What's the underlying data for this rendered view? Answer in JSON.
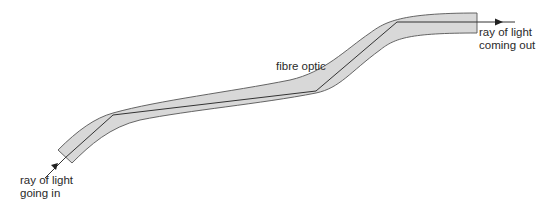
{
  "diagram": {
    "labels": {
      "fibre": "fibre optic",
      "ray_in_line1": "ray of light",
      "ray_in_line2": "going in",
      "ray_out_line1": "ray of light",
      "ray_out_line2": "coming out"
    },
    "colors": {
      "fibre_fill": "#d8d8d8",
      "fibre_outline": "#555555",
      "ray": "#333333",
      "text": "#2a2a2a"
    }
  }
}
